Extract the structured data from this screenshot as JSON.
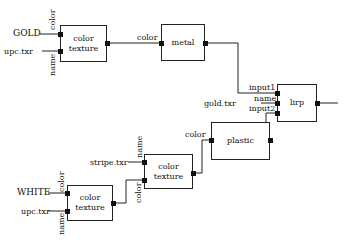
{
  "nodes": [
    {
      "id": "ct1",
      "label": "color\ntexture",
      "line1": "color",
      "line2": "texture"
    },
    {
      "id": "metal",
      "label": "metal"
    },
    {
      "id": "lirp",
      "label": "lirp"
    },
    {
      "id": "plastic",
      "label": "plastic"
    },
    {
      "id": "ct2",
      "line1": "color",
      "line2": "texture"
    },
    {
      "id": "ct3",
      "line1": "color",
      "line2": "texture"
    }
  ],
  "labels": {
    "gold": "GOLD",
    "upc1": "upc.txr",
    "ct1_color": "color",
    "ct1_name": "name",
    "metal_in": "color",
    "input1": "input1",
    "name": "name",
    "input2": "input2",
    "gold_txr": "gold.txr",
    "plastic_in": "color",
    "stripe": "stripe.txr",
    "ct2_name": "name",
    "ct2_color": "color",
    "white": "WHITE",
    "upc2": "upc.txr",
    "ct3_color": "color",
    "ct3_name": "name"
  }
}
